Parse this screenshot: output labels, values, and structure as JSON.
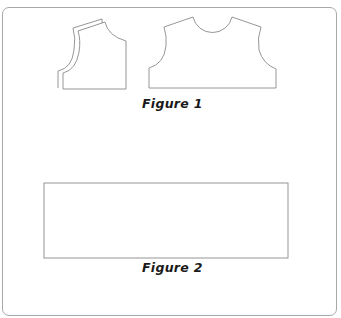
{
  "figures": [
    {
      "caption": "Figure 1",
      "content": "Two bodice pattern pieces: a folded front/side piece with layered neckline and a back bodice piece with rounded neckline and armholes"
    },
    {
      "caption": "Figure 2",
      "content": "Plain rectangular pattern piece"
    }
  ],
  "colors": {
    "outline": "#8a8a8a",
    "frame": "#a8a8a8",
    "caption": "#1a1a1a",
    "background": "#ffffff"
  }
}
